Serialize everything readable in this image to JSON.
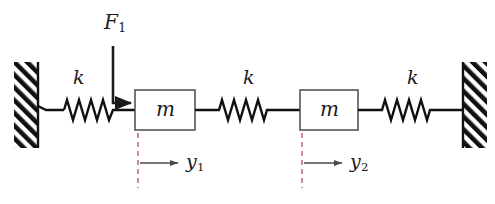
{
  "figure": {
    "type": "mechanical-system-schematic",
    "background_color": "#ffffff",
    "line_color": "#1a1a1a"
  },
  "walls": {
    "left": {
      "name": "left-wall",
      "hatched": true
    },
    "right": {
      "name": "right-wall",
      "hatched": true
    }
  },
  "springs": [
    {
      "id": "spring-left",
      "label": "k",
      "coils": 7
    },
    {
      "id": "spring-middle",
      "label": "k",
      "coils": 6
    },
    {
      "id": "spring-right",
      "label": "k",
      "coils": 6
    }
  ],
  "masses": [
    {
      "id": "mass-1",
      "label": "m"
    },
    {
      "id": "mass-2",
      "label": "m"
    }
  ],
  "force": {
    "id": "force-f1",
    "symbol": "F",
    "subscript": "1",
    "direction": "right",
    "applied_to": "mass-1"
  },
  "displacements": [
    {
      "id": "displacement-y1",
      "symbol": "y",
      "subscript": "1",
      "direction": "right",
      "of": "mass-1"
    },
    {
      "id": "displacement-y2",
      "symbol": "y",
      "subscript": "2",
      "direction": "right",
      "of": "mass-2"
    }
  ],
  "labels": {
    "k_left": "k",
    "k_middle": "k",
    "k_right": "k",
    "m_left": "m",
    "m_right": "m",
    "force_symbol": "F",
    "force_sub": "1",
    "y1_symbol": "y",
    "y1_sub": "1",
    "y2_symbol": "y",
    "y2_sub": "2"
  }
}
